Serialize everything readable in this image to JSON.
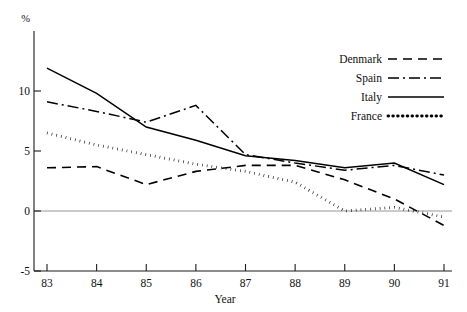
{
  "chart_data": {
    "type": "line",
    "title": "",
    "xlabel": "Year",
    "ylabel": "%",
    "unit_label": "%",
    "x": [
      83,
      84,
      85,
      86,
      87,
      88,
      89,
      90,
      91
    ],
    "xtick_labels": [
      "83",
      "84",
      "85",
      "86",
      "87",
      "88",
      "89",
      "90",
      "91"
    ],
    "ytick_labels": [
      "20",
      "10",
      "5",
      "0",
      "-5"
    ],
    "ytick_values": [
      20,
      10,
      5,
      0,
      -5
    ],
    "xlim": [
      83,
      91
    ],
    "ylim": [
      -5,
      20
    ],
    "grid": false,
    "zero_line": true,
    "legend_position": "top-right",
    "series": [
      {
        "name": "Denmark",
        "style": "dashed",
        "dash": "9 6",
        "width": 1.6,
        "values": [
          3.6,
          3.7,
          2.2,
          3.3,
          3.8,
          3.8,
          2.6,
          1.0,
          -1.2
        ]
      },
      {
        "name": "Spain",
        "style": "dash-dot",
        "dash": "11 4 2 4",
        "width": 1.5,
        "values": [
          9.1,
          8.3,
          7.4,
          8.8,
          4.7,
          4.0,
          3.4,
          3.8,
          3.0
        ]
      },
      {
        "name": "Italy",
        "style": "solid",
        "dash": "",
        "width": 1.5,
        "values": [
          11.9,
          9.8,
          7.0,
          5.9,
          4.6,
          4.2,
          3.6,
          4.0,
          2.2
        ]
      },
      {
        "name": "France",
        "style": "dotted",
        "dash": "0.6 4.2",
        "width": 2.9,
        "values": [
          6.5,
          5.5,
          4.7,
          3.9,
          3.3,
          2.4,
          0.0,
          0.3,
          -0.5
        ]
      }
    ]
  },
  "legend": {
    "items": [
      {
        "label": "Denmark",
        "style": "dashed"
      },
      {
        "label": "Spain",
        "style": "dash-dot"
      },
      {
        "label": "Italy",
        "style": "solid"
      },
      {
        "label": "France",
        "style": "dotted"
      }
    ]
  },
  "colors": {
    "ink": "#000000",
    "axis": "#1a1a1a",
    "zero_line": "#8a8a8a",
    "background": "#ffffff"
  }
}
